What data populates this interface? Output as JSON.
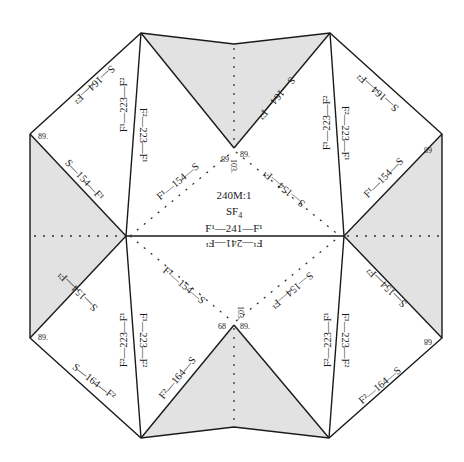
{
  "center": {
    "scale": "240M:1",
    "formula": "SF",
    "formula_sub": "4",
    "bond_top": "F¹—241—F¹",
    "bond_bottom": "F¹—241—F¹"
  },
  "colors": {
    "line": "#1a1a1a",
    "fill": "#e2e2e2",
    "background": "#ffffff"
  },
  "edge_labels": {
    "top_left_outer": "S—164—F²",
    "top_left_inner_a": "F¹—223—F²",
    "top_left_inner_b": "F²—223—F¹",
    "left_upper": "S—154—F¹",
    "center_ul": "F¹—154—S",
    "top_right_notch": "S—164—F²",
    "top_right_inner_a": "F¹—223—F²",
    "top_right_inner_b": "F²—223—F¹",
    "top_right_outer": "S—164—F²",
    "right_upper": "F¹—154—S",
    "center_ur": "S—154—F¹",
    "left_lower": "S—154—F¹",
    "center_ll": "F¹—154—S",
    "bottom_left_inner_a": "F²—223—F¹",
    "bottom_left_inner_b": "F¹—223—F²",
    "bottom_left_outer": "S—164—F²",
    "bottom_left_notch": "F²—164—S",
    "center_lr": "S—154—F¹",
    "bottom_right_inner_a": "F²—223—F¹",
    "bottom_right_inner_b": "F¹—223—F²",
    "right_lower": "S—154—F²",
    "bottom_right_outer": "F²—164—S",
    "top_left_notch": "F²—164—S"
  },
  "angle_labels": {
    "a89": "89.",
    "a68": "68",
    "a103": "103."
  }
}
